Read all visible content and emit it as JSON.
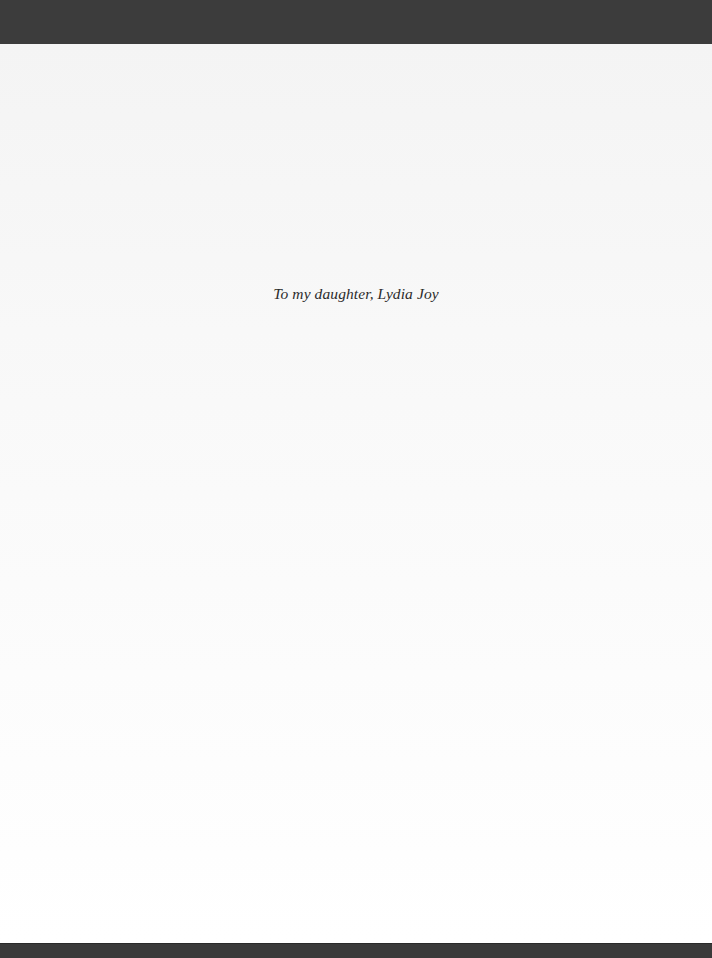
{
  "page": {
    "dedication": "To my daughter, Lydia Joy"
  },
  "colors": {
    "frame": "#3c3c3c",
    "page_background": "#f8f8f8",
    "text": "#2b2b2b"
  }
}
